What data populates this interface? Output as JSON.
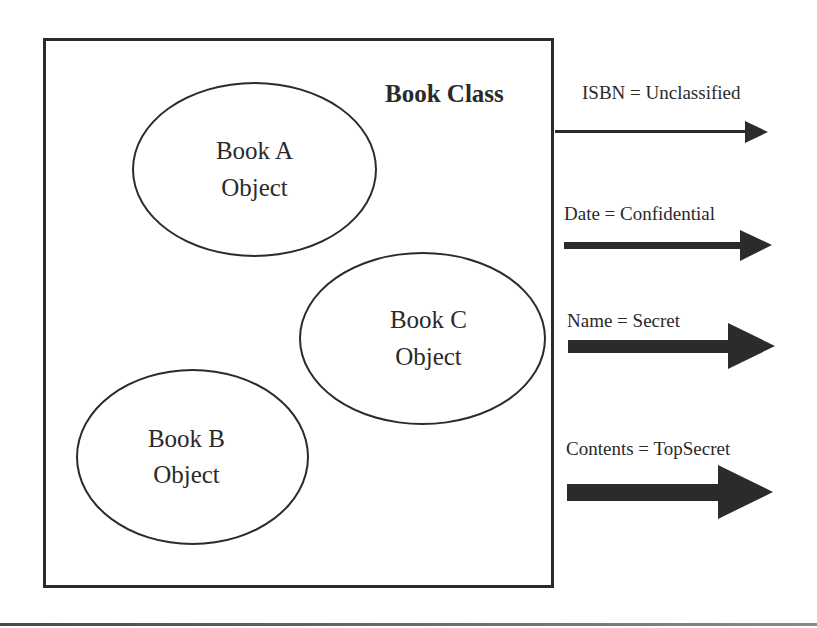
{
  "diagram": {
    "class_title": "Book Class",
    "objects": [
      {
        "line1": "Book A",
        "line2": "Object"
      },
      {
        "line1": "Book C",
        "line2": "Object"
      },
      {
        "line1": "Book B",
        "line2": "Object"
      }
    ],
    "attributes": [
      {
        "label": "ISBN = Unclassified",
        "attribute": "ISBN",
        "classification": "Unclassified"
      },
      {
        "label": "Date = Confidential",
        "attribute": "Date",
        "classification": "Confidential"
      },
      {
        "label": "Name = Secret",
        "attribute": "Name",
        "classification": "Secret"
      },
      {
        "label": "Contents = TopSecret",
        "attribute": "Contents",
        "classification": "TopSecret"
      }
    ],
    "colors": {
      "stroke": "#2b2b2b",
      "background": "#ffffff"
    }
  }
}
